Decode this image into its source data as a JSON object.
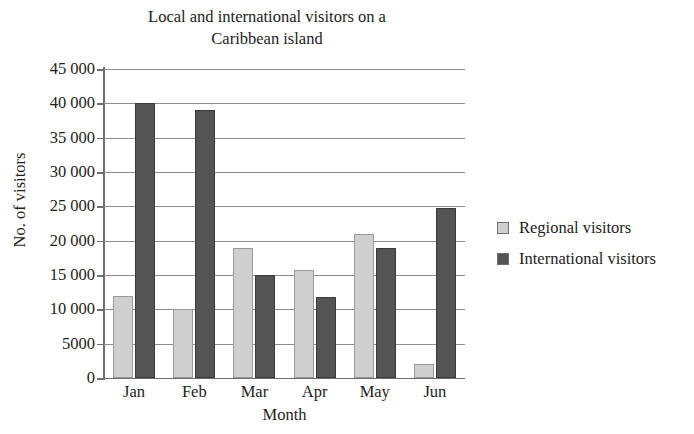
{
  "chart_data": {
    "type": "bar",
    "title": "Local and international visitors on a\nCaribbean island",
    "xlabel": "Month",
    "ylabel": "No. of visitors",
    "categories": [
      "Jan",
      "Feb",
      "Mar",
      "Apr",
      "May",
      "Jun"
    ],
    "series": [
      {
        "name": "Regional visitors",
        "color": "#cfcfcf",
        "values": [
          12000,
          10000,
          19000,
          15800,
          21000,
          2000
        ]
      },
      {
        "name": "International visitors",
        "color": "#545454",
        "values": [
          40000,
          39000,
          15000,
          11800,
          19000,
          24800
        ]
      }
    ],
    "ylim": [
      0,
      45000
    ],
    "ytick_values": [
      0,
      5000,
      10000,
      15000,
      20000,
      25000,
      30000,
      35000,
      40000,
      45000
    ],
    "ytick_labels": [
      "0",
      "5000",
      "10 000",
      "15 000",
      "20 000",
      "25 000",
      "30 000",
      "35 000",
      "40 000",
      "45 000"
    ],
    "grid": true,
    "grid_axis": "y",
    "legend_position": "right",
    "legend_entries": [
      "Regional visitors",
      "International visitors"
    ]
  }
}
